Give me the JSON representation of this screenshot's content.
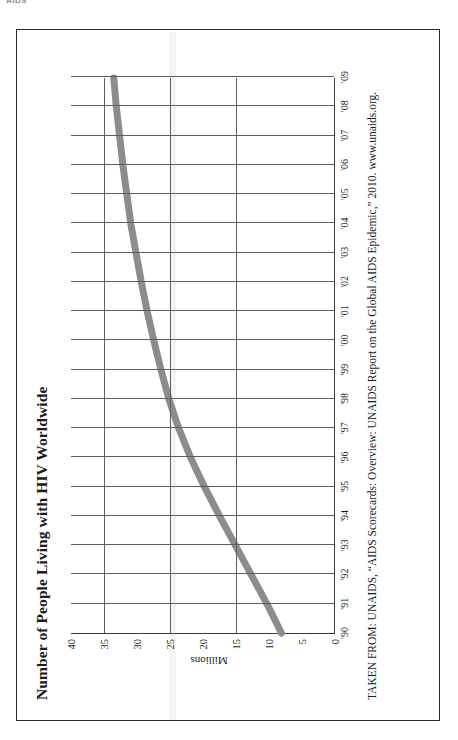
{
  "scan": {
    "header_text": "AIDS"
  },
  "page": {
    "title": "Number of People Living with HIV Worldwide",
    "source_note": "TAKEN FROM: UNAIDS, “AIDS Scorecards: Overview: UNAIDS Report on the Global AIDS Epidemic,” 2010. www.unaids.org.",
    "line_color": "#8c8c8c",
    "axis_color": "#3a3a3a",
    "grid_color": "#5d5d5d",
    "frame_color": "#2b2b2b",
    "rotation_degrees": "-90"
  },
  "chart_data": {
    "type": "line",
    "title": "Number of People Living with HIV Worldwide",
    "xlabel": "",
    "ylabel": "Millions",
    "x": [
      "'90",
      "'91",
      "'92",
      "'93",
      "'94",
      "'95",
      "'96",
      "'97",
      "'98",
      "'99",
      "'00",
      "'01",
      "'02",
      "'03",
      "'04",
      "'05",
      "'06",
      "'07",
      "'08",
      "'09"
    ],
    "values": [
      8.0,
      10.2,
      12.6,
      15.0,
      17.4,
      19.7,
      21.8,
      23.6,
      25.1,
      26.3,
      27.4,
      28.4,
      29.3,
      30.1,
      30.9,
      31.5,
      32.1,
      32.6,
      33.1,
      33.5
    ],
    "ylim": [
      0,
      40
    ],
    "yticks": [
      0,
      5,
      10,
      15,
      20,
      25,
      30,
      35,
      40
    ],
    "ytick_labels": [
      "0",
      "5",
      "10",
      "15",
      "20",
      "25",
      "30",
      "35",
      "40"
    ],
    "major_gridlines_y": [
      15,
      25,
      35
    ],
    "grid": "vertical-every-year, horizontal-major-only",
    "legend": "none",
    "series": [
      {
        "name": "People living with HIV worldwide (millions)",
        "values": [
          8.0,
          10.2,
          12.6,
          15.0,
          17.4,
          19.7,
          21.8,
          23.6,
          25.1,
          26.3,
          27.4,
          28.4,
          29.3,
          30.1,
          30.9,
          31.5,
          32.1,
          32.6,
          33.1,
          33.5
        ]
      }
    ]
  }
}
